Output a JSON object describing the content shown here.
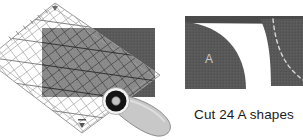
{
  "figure": {
    "background_color": "#ffffff"
  },
  "colors": {
    "fabric_gray": "#5a5a5a",
    "fabric_gray_dark": "#4e4e4e",
    "fabric_gray_light": "#666666",
    "ruler_line": "#8d8d8d",
    "ruler_line_dark": "#5f5f5f",
    "ruler_fill": "#f2f2f2",
    "cutter_blade": "#141414",
    "cutter_handle": "#c8c8c8",
    "cutter_handle_edge": "#8a8a8a",
    "cutter_hub_ring": "#f4f4f4",
    "letter_label": "#c9c9c9",
    "dashed_line": "#d8d8d8",
    "caption_text": "#1b1b1b",
    "white": "#ffffff"
  },
  "left_panel": {
    "name": "rotary-cutting-illustration",
    "description": "Transparent gridded quilting ruler laid at an angle over a dark gray fabric rectangle, with a rotary cutter running along the ruler edge",
    "fabric": {
      "label": "fabric-rectangle",
      "x": 42,
      "y": 28,
      "width": 113,
      "height": 69,
      "color": "#5a5a5a"
    },
    "ruler": {
      "label": "quilting-ruler",
      "rotation_degrees": -45,
      "corner_top": [
        55,
        3
      ],
      "corner_bottom": [
        82,
        133
      ],
      "grid_spacing_px": 9,
      "has_diagonal_45_lines": true,
      "has_edge_tick_marks": true
    },
    "cutter": {
      "label": "rotary-cutter",
      "blade_center": [
        116,
        101
      ],
      "blade_radius": 11,
      "handle_angle_degrees": 28
    }
  },
  "right_panel": {
    "name": "cut-shapes-diagram",
    "pieces": [
      {
        "label": "piece-A",
        "letter": "A",
        "description": "quarter-circle convex shape cut from fabric square"
      },
      {
        "label": "piece-remainder",
        "letter": "",
        "description": "concave remainder piece with dashed stitching guide"
      }
    ],
    "top_strip": {
      "label": "fabric-strip-edge",
      "description": "thin dark fabric strip across the top"
    },
    "dashed_guide": {
      "label": "seam-guide-dashes",
      "color": "#d8d8d8",
      "style": "dashed"
    },
    "caption": "Cut 24 A shapes",
    "cut_count": 24,
    "shape_letter": "A"
  }
}
